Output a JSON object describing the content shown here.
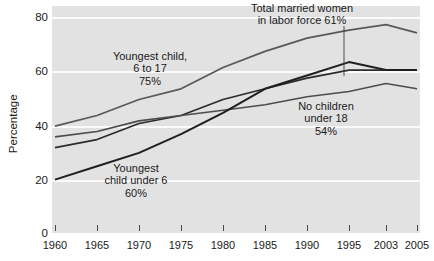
{
  "chart_data": {
    "type": "line",
    "title": "",
    "subtitle": "",
    "xlabel": "",
    "ylabel": "Percentage",
    "ylim": [
      0,
      88
    ],
    "xlim": [
      1960,
      2005
    ],
    "grid": true,
    "grid_color": "#fbfbfb",
    "plot_background": "#e2e2e2",
    "legend_position": "inline-annotations",
    "yticks": [
      0,
      20,
      40,
      60,
      80
    ],
    "ytick_labels": [
      "0",
      "20",
      "40",
      "60",
      "80"
    ],
    "xticks": [
      1960,
      1965,
      1970,
      1975,
      1980,
      1985,
      1990,
      1995,
      2003,
      2005
    ],
    "xtick_labels": [
      "1960",
      "1965",
      "1970",
      "1975",
      "1980",
      "1985",
      "1990",
      "1995",
      "2003",
      "2005"
    ],
    "xtick_positions_px": [
      55,
      97,
      139,
      181,
      223,
      265,
      307,
      349,
      386,
      417
    ],
    "series": [
      {
        "name": "Youngest child, 6 to 17",
        "color": "#595959",
        "width": 1.8,
        "x": [
          1960,
          1965,
          1970,
          1975,
          1980,
          1985,
          1990,
          1995,
          2003,
          2005
        ],
        "values": [
          40,
          44,
          50,
          54,
          62,
          68,
          73,
          76,
          78,
          75
        ]
      },
      {
        "name": "Total married women in labor force",
        "color": "#2b2b2b",
        "width": 1.6,
        "x": [
          1960,
          1965,
          1970,
          1975,
          1980,
          1985,
          1990,
          1995,
          2003,
          2005
        ],
        "values": [
          32,
          35,
          41,
          44,
          50,
          54,
          58,
          61,
          61,
          61
        ]
      },
      {
        "name": "No children under 18",
        "color": "#4d4d4d",
        "width": 1.6,
        "x": [
          1960,
          1965,
          1970,
          1975,
          1980,
          1985,
          1990,
          1995,
          2003,
          2005
        ],
        "values": [
          36,
          38,
          42,
          44,
          46,
          48,
          51,
          53,
          56,
          54
        ]
      },
      {
        "name": "Youngest child under 6",
        "color": "#1f1f1f",
        "width": 2.0,
        "x": [
          1960,
          1965,
          1970,
          1975,
          1980,
          1985,
          1990,
          1995,
          2003,
          2005
        ],
        "values": [
          20,
          25,
          30,
          37,
          45,
          54,
          59,
          64,
          61,
          61
        ]
      }
    ],
    "annotations": [
      {
        "id": "youngest-6-to-17",
        "text": "Youngest child,\n6 to 17\n75%"
      },
      {
        "id": "total-married-women",
        "text": "Total married women\nin labor force 61%"
      },
      {
        "id": "no-children-under-18",
        "text": "No children\nunder 18\n54%"
      },
      {
        "id": "youngest-under-6",
        "text": "Youngest\nchild under 6\n60%"
      }
    ]
  }
}
